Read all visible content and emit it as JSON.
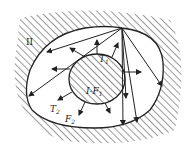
{
  "labels": {
    "outer_region": "II",
    "inner_temp": "T",
    "inner_temp_sub": "1",
    "inner_body": "I-F",
    "inner_body_sub": "1",
    "outer_temp": "T",
    "outer_temp_sub": "2",
    "outer_surface": "F",
    "outer_surface_sub": "2"
  },
  "colors": {
    "stroke": "#222222",
    "background": "#ffffff"
  }
}
